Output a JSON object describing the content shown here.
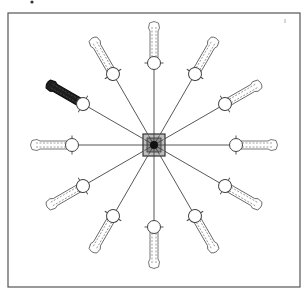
{
  "diagram": {
    "title": "",
    "type": "radial-arm-layout",
    "arm_count": 12,
    "angle_step_deg": 30,
    "highlighted_arm_index": 5,
    "colors": {
      "frame": "#555555",
      "arm_outline": "#555555",
      "highlight_fill": "#1e1e1e",
      "hub_outer": "#bdbdbd",
      "hub_core": "#111111",
      "background": "#ffffff"
    },
    "geometry": {
      "center": [
        154,
        145
      ],
      "joint_radius": 82,
      "arm_tip_radius": 124,
      "hub_size": 22
    },
    "arms": [
      {
        "angle": 0,
        "label": ""
      },
      {
        "angle": 30,
        "label": ""
      },
      {
        "angle": 60,
        "label": ""
      },
      {
        "angle": 90,
        "label": ""
      },
      {
        "angle": 120,
        "label": ""
      },
      {
        "angle": 150,
        "label": "",
        "highlighted": true
      },
      {
        "angle": 180,
        "label": ""
      },
      {
        "angle": 210,
        "label": ""
      },
      {
        "angle": 240,
        "label": ""
      },
      {
        "angle": 270,
        "label": ""
      },
      {
        "angle": 300,
        "label": ""
      },
      {
        "angle": 330,
        "label": ""
      }
    ]
  }
}
